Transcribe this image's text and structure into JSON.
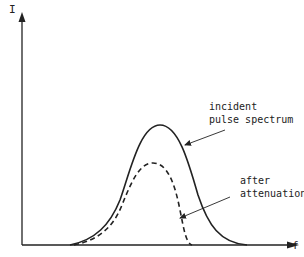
{
  "diagram": {
    "y_axis_label": "I",
    "x_axis_label": "f",
    "curves": [
      {
        "name": "incident pulse spectrum",
        "style": "solid",
        "relative_peak": 1.0
      },
      {
        "name": "after attenuation",
        "style": "dashed",
        "relative_peak": 0.72
      }
    ],
    "annotations": {
      "incident_line1": "incident",
      "incident_line2": "pulse spectrum",
      "after_line1": "after",
      "after_line2": "attenuation"
    },
    "colors": {
      "ink": "#222222",
      "background": "#ffffff"
    }
  }
}
